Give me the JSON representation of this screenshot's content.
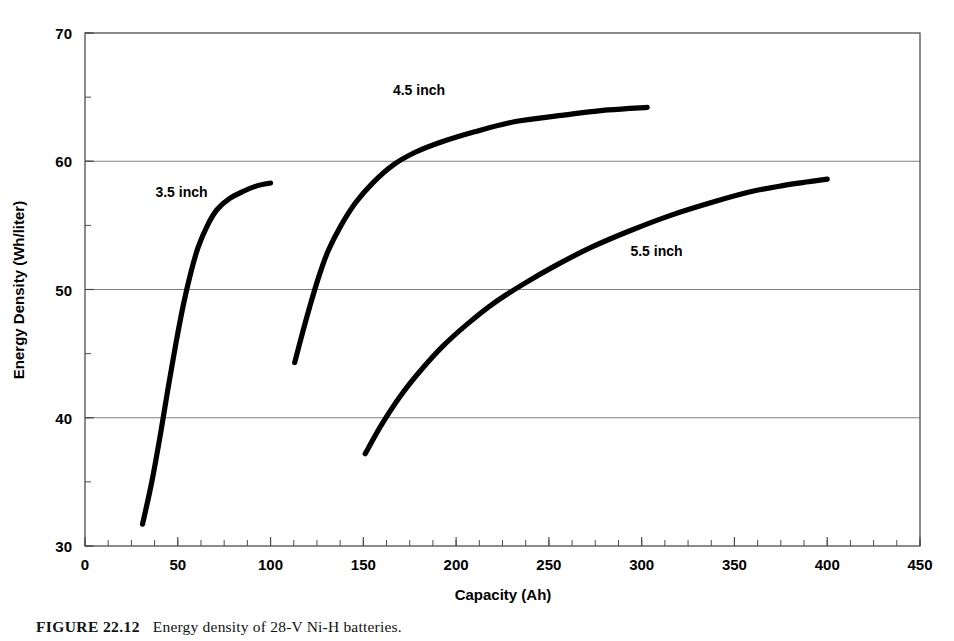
{
  "figure": {
    "caption_number": "FIGURE 22.12",
    "caption_text": "Energy density of 28-V Ni-H batteries."
  },
  "chart_data": {
    "type": "line",
    "title": "",
    "xlabel": "Capacity (Ah)",
    "ylabel": "Energy Density (Wh/liter)",
    "xlim": [
      0,
      450
    ],
    "ylim": [
      30,
      70
    ],
    "x_major_step": 50,
    "x_minor_step": 12.5,
    "y_major_step": 10,
    "y_minor_step": 5,
    "grid": "horizontal-major",
    "grid_values": [
      40,
      50,
      60
    ],
    "legend_position": "inline-annotations",
    "x_ticks": [
      "0",
      "50",
      "100",
      "150",
      "200",
      "250",
      "300",
      "350",
      "400",
      "450"
    ],
    "y_ticks": [
      "30",
      "40",
      "50",
      "60",
      "70"
    ],
    "line_color": "#000000",
    "grid_color": "#808080",
    "axis_color": "#4d4d4d",
    "series": [
      {
        "name": "3.5 inch",
        "label": "3.5 inch",
        "label_x": 52,
        "label_y": 57.2,
        "points": [
          [
            31,
            31.7
          ],
          [
            36,
            35.0
          ],
          [
            41,
            39.0
          ],
          [
            45,
            42.5
          ],
          [
            49,
            45.8
          ],
          [
            53,
            48.8
          ],
          [
            57,
            51.3
          ],
          [
            61,
            53.3
          ],
          [
            66,
            55.0
          ],
          [
            71,
            56.2
          ],
          [
            78,
            57.1
          ],
          [
            86,
            57.7
          ],
          [
            93,
            58.1
          ],
          [
            100,
            58.3
          ]
        ]
      },
      {
        "name": "4.5 inch",
        "label": "4.5 inch",
        "label_x": 180,
        "label_y": 65.2,
        "points": [
          [
            113,
            44.3
          ],
          [
            117,
            46.5
          ],
          [
            121,
            48.6
          ],
          [
            126,
            51.0
          ],
          [
            131,
            53.0
          ],
          [
            138,
            55.0
          ],
          [
            146,
            56.8
          ],
          [
            155,
            58.3
          ],
          [
            166,
            59.7
          ],
          [
            178,
            60.7
          ],
          [
            192,
            61.5
          ],
          [
            210,
            62.3
          ],
          [
            232,
            63.1
          ],
          [
            258,
            63.6
          ],
          [
            282,
            64.0
          ],
          [
            303,
            64.2
          ]
        ]
      },
      {
        "name": "5.5 inch",
        "label": "5.5 inch",
        "label_x": 308,
        "label_y": 52.6,
        "points": [
          [
            151,
            37.2
          ],
          [
            160,
            39.5
          ],
          [
            170,
            41.7
          ],
          [
            181,
            43.7
          ],
          [
            193,
            45.6
          ],
          [
            206,
            47.3
          ],
          [
            220,
            48.9
          ],
          [
            236,
            50.4
          ],
          [
            254,
            51.9
          ],
          [
            273,
            53.3
          ],
          [
            294,
            54.6
          ],
          [
            316,
            55.8
          ],
          [
            338,
            56.8
          ],
          [
            358,
            57.6
          ],
          [
            376,
            58.1
          ],
          [
            390,
            58.4
          ],
          [
            400,
            58.6
          ]
        ]
      }
    ]
  }
}
